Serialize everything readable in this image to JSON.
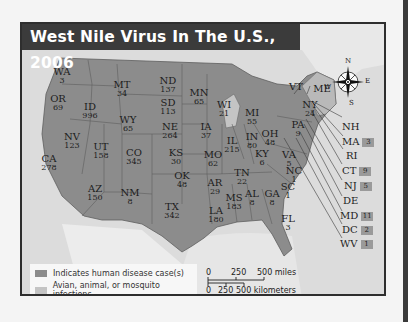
{
  "title": "West Nile Virus In The U.S., 2006",
  "colors": {
    "frame": "#2e2e2e",
    "title_bg": "#3b3b3b",
    "water_land_bg": "#dedede",
    "human_case_state": "#8c8c8c",
    "non_human_state": "#c4c4c4",
    "badge": "#9a9a9a"
  },
  "compass": {
    "n": "N",
    "e": "E",
    "s": "S",
    "w": "W"
  },
  "states": [
    {
      "abbr": "WA",
      "cases": "3"
    },
    {
      "abbr": "OR",
      "cases": "69"
    },
    {
      "abbr": "ID",
      "cases": "996"
    },
    {
      "abbr": "MT",
      "cases": "34"
    },
    {
      "abbr": "WY",
      "cases": "65"
    },
    {
      "abbr": "NV",
      "cases": "123"
    },
    {
      "abbr": "UT",
      "cases": "158"
    },
    {
      "abbr": "CO",
      "cases": "345"
    },
    {
      "abbr": "CA",
      "cases": "278"
    },
    {
      "abbr": "AZ",
      "cases": "150"
    },
    {
      "abbr": "NM",
      "cases": "8"
    },
    {
      "abbr": "ND",
      "cases": "137"
    },
    {
      "abbr": "SD",
      "cases": "113"
    },
    {
      "abbr": "NE",
      "cases": "264"
    },
    {
      "abbr": "KS",
      "cases": "30"
    },
    {
      "abbr": "OK",
      "cases": "48"
    },
    {
      "abbr": "TX",
      "cases": "342"
    },
    {
      "abbr": "MN",
      "cases": "65"
    },
    {
      "abbr": "IA",
      "cases": "37"
    },
    {
      "abbr": "MO",
      "cases": "62"
    },
    {
      "abbr": "AR",
      "cases": "29"
    },
    {
      "abbr": "LA",
      "cases": "180"
    },
    {
      "abbr": "WI",
      "cases": "21"
    },
    {
      "abbr": "IL",
      "cases": "215"
    },
    {
      "abbr": "MI",
      "cases": "55"
    },
    {
      "abbr": "IN",
      "cases": "80"
    },
    {
      "abbr": "OH",
      "cases": "48"
    },
    {
      "abbr": "KY",
      "cases": "6"
    },
    {
      "abbr": "TN",
      "cases": "22"
    },
    {
      "abbr": "MS",
      "cases": "183"
    },
    {
      "abbr": "AL",
      "cases": "8"
    },
    {
      "abbr": "GA",
      "cases": "8"
    },
    {
      "abbr": "FL",
      "cases": "3"
    },
    {
      "abbr": "SC",
      "cases": "1"
    },
    {
      "abbr": "NC",
      "cases": "1"
    },
    {
      "abbr": "VA",
      "cases": "5"
    },
    {
      "abbr": "PA",
      "cases": "9"
    },
    {
      "abbr": "NY",
      "cases": "24"
    },
    {
      "abbr": "VT",
      "cases": ""
    },
    {
      "abbr": "ME",
      "cases": ""
    }
  ],
  "northeast_callouts": [
    {
      "abbr": "NH",
      "cases": ""
    },
    {
      "abbr": "MA",
      "cases": "3"
    },
    {
      "abbr": "RI",
      "cases": ""
    },
    {
      "abbr": "CT",
      "cases": "9"
    },
    {
      "abbr": "NJ",
      "cases": "5"
    },
    {
      "abbr": "DE",
      "cases": ""
    },
    {
      "abbr": "MD",
      "cases": "11"
    },
    {
      "abbr": "DC",
      "cases": "2"
    },
    {
      "abbr": "WV",
      "cases": "1"
    }
  ],
  "legend": [
    {
      "label": "Indicates human disease case(s)",
      "color": "#8c8c8c"
    },
    {
      "label": "Avian, animal, or mosquito infections",
      "color": "#c4c4c4"
    }
  ],
  "scale": {
    "miles": {
      "ticks": [
        "0",
        "250",
        "500 miles"
      ]
    },
    "kilometers": {
      "ticks": [
        "0",
        "250",
        "500 kilometers"
      ]
    }
  }
}
